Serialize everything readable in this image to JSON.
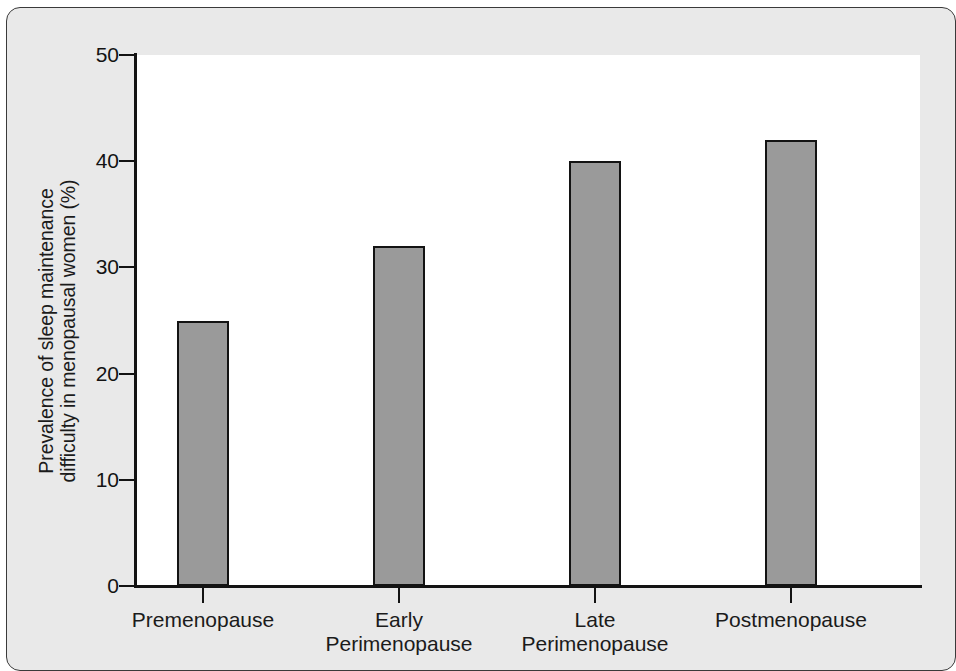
{
  "chart_data": {
    "type": "bar",
    "title": "",
    "xlabel": "",
    "ylabel": "Prevalence of sleep maintenance difficulty in menopausal women (%)",
    "ylabel_lines": [
      "Prevalence of sleep maintenance",
      "difficulty in menopausal women (%)"
    ],
    "categories": [
      "Premenopause",
      "Early Perimenopause",
      "Late Perimenopause",
      "Postmenopause"
    ],
    "category_lines": [
      [
        "Premenopause"
      ],
      [
        "Early",
        "Perimenopause"
      ],
      [
        "Late",
        "Perimenopause"
      ],
      [
        "Postmenopause"
      ]
    ],
    "values": [
      25,
      32,
      40,
      42
    ],
    "ylim": [
      0,
      50
    ],
    "yticks": [
      0,
      10,
      20,
      30,
      40,
      50
    ],
    "ytick_labels": [
      "0",
      "10",
      "20",
      "30",
      "40",
      "50"
    ],
    "grid": false,
    "legend": null,
    "bar_color": "#9a9a9a",
    "bar_edge_color": "#131313",
    "axis_color": "#131313",
    "plot_background": "#ffffff",
    "figure_background": "#e9e9e9"
  }
}
